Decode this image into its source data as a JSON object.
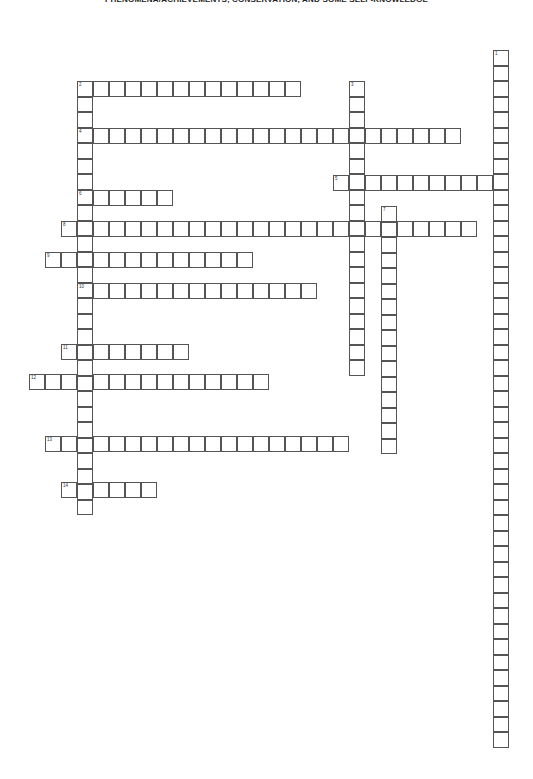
{
  "puzzle": {
    "title": "PHENOMENA/ACHIEVEMENTS, CONSERVATION, AND SOME SELF-KNOWLEDGE",
    "entries": [
      {
        "number": 1,
        "direction": "down",
        "row": 0,
        "col": 29,
        "length": 45
      },
      {
        "number": 2,
        "direction": "across",
        "row": 2,
        "col": 3,
        "length": 14
      },
      {
        "number": 2,
        "direction": "down",
        "row": 2,
        "col": 3,
        "length": 28
      },
      {
        "number": 3,
        "direction": "down",
        "row": 2,
        "col": 20,
        "length": 19
      },
      {
        "number": 4,
        "direction": "across",
        "row": 5,
        "col": 3,
        "length": 24
      },
      {
        "number": 5,
        "direction": "across",
        "row": 8,
        "col": 19,
        "length": 11
      },
      {
        "number": 6,
        "direction": "across",
        "row": 9,
        "col": 3,
        "length": 6
      },
      {
        "number": 7,
        "direction": "down",
        "row": 10,
        "col": 22,
        "length": 16
      },
      {
        "number": 8,
        "direction": "across",
        "row": 11,
        "col": 2,
        "length": 26
      },
      {
        "number": 9,
        "direction": "across",
        "row": 13,
        "col": 1,
        "length": 13
      },
      {
        "number": 10,
        "direction": "across",
        "row": 15,
        "col": 3,
        "length": 15
      },
      {
        "number": 11,
        "direction": "across",
        "row": 19,
        "col": 2,
        "length": 8
      },
      {
        "number": 12,
        "direction": "across",
        "row": 21,
        "col": 0,
        "length": 15
      },
      {
        "number": 13,
        "direction": "across",
        "row": 25,
        "col": 1,
        "length": 19
      },
      {
        "number": 14,
        "direction": "across",
        "row": 28,
        "col": 2,
        "length": 6
      }
    ]
  }
}
